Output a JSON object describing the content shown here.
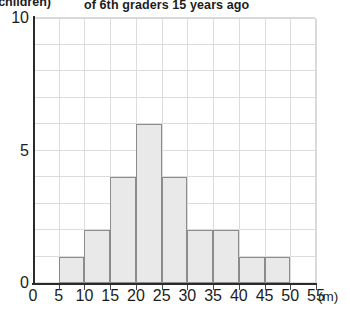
{
  "chart_data": {
    "type": "bar",
    "title": "of 6th graders 15 years ago",
    "xlabel": "",
    "ylabel": "",
    "x_unit": "(m)",
    "y_unit": "(children)",
    "grid": true,
    "legend": "none",
    "xlim": [
      0,
      55
    ],
    "ylim": [
      0,
      10
    ],
    "x_ticks": [
      "0",
      "5",
      "10",
      "15",
      "20",
      "25",
      "30",
      "35",
      "40",
      "45",
      "50",
      "55"
    ],
    "y_ticks": [
      "0",
      "5",
      "10"
    ],
    "bin_width": 5,
    "categories": [
      "5-10",
      "10-15",
      "15-20",
      "20-25",
      "25-30",
      "30-35",
      "35-40",
      "40-45",
      "45-50"
    ],
    "bin_starts": [
      5,
      10,
      15,
      20,
      25,
      30,
      35,
      40,
      45
    ],
    "values": [
      1,
      2,
      4,
      6,
      4,
      2,
      2,
      1,
      1
    ],
    "bar_fill": "#e9e9e9",
    "bar_stroke": "#8c8c8c",
    "grid_color": "#dcdcdc",
    "axis_color": "#2b2b2b"
  }
}
